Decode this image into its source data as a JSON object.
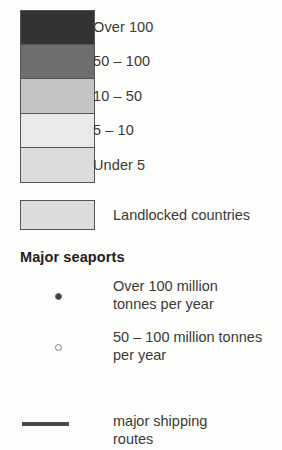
{
  "legend": {
    "density_classes": [
      {
        "label": "Over 100",
        "color": "#333333"
      },
      {
        "label": "50 – 100",
        "color": "#6e6e6e"
      },
      {
        "label": "10 – 50",
        "color": "#c4c4c4"
      },
      {
        "label": "5 – 10",
        "color": "#e9e9e9"
      },
      {
        "label": "Under 5",
        "color": "#dcdcdc"
      }
    ],
    "landlocked": {
      "label": "Landlocked countries",
      "color": "#dcdcdc"
    },
    "seaports": {
      "heading": "Major seaports",
      "entries": [
        {
          "marker": "filled-dot",
          "line1": "Over 100 million",
          "line2": "tonnes per year"
        },
        {
          "marker": "hollow-dot",
          "line1": "50 – 100 million tonnes",
          "line2": "per year"
        }
      ]
    },
    "routes": {
      "line1": "major shipping",
      "line2": "routes",
      "color": "#4a4a4a"
    }
  }
}
